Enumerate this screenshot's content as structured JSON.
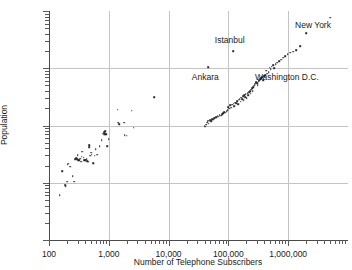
{
  "chart_data": {
    "type": "scatter",
    "title": "",
    "xlabel": "Number of Telephone Subscribers",
    "ylabel": "Population",
    "xscale": "log",
    "yscale": "log",
    "xlim": [
      100,
      10000000
    ],
    "ylim": [
      1000,
      10000000
    ],
    "grid": true,
    "legend": "none",
    "xticks": [
      {
        "value": 100,
        "label": "100"
      },
      {
        "value": 1000,
        "label": "1,000"
      },
      {
        "value": 10000,
        "label": "10,000"
      },
      {
        "value": 100000,
        "label": "100,000"
      },
      {
        "value": 1000000,
        "label": "1,000,000"
      }
    ],
    "yticks": [
      {
        "value": 1000,
        "label": "1,000"
      },
      {
        "value": 10000,
        "label": "10,000"
      },
      {
        "value": 100000,
        "label": "100,000"
      },
      {
        "value": 1000000,
        "label": "1,000,000"
      },
      {
        "value": 10000000,
        "label": "10,000,000"
      }
    ],
    "annotations": [
      {
        "text": "New York",
        "x": 5000000,
        "y": 7600000,
        "label_x": 2600000,
        "label_y": 5600000
      },
      {
        "text": "Istanbul",
        "x": 120000,
        "y": 2000000,
        "label_x": 105000,
        "label_y": 3100000
      },
      {
        "text": "Ankara",
        "x": 46000,
        "y": 1050000,
        "label_x": 41000,
        "label_y": 700000
      },
      {
        "text": "Washington D.C.",
        "x": 430000,
        "y": 900000,
        "label_x": 950000,
        "label_y": 690000
      }
    ],
    "points": [
      [
        150,
        6100
      ],
      [
        165,
        16000
      ],
      [
        185,
        9100
      ],
      [
        190,
        8600
      ],
      [
        200,
        10400
      ],
      [
        205,
        21000
      ],
      [
        215,
        21500
      ],
      [
        225,
        19200
      ],
      [
        250,
        13000
      ],
      [
        262,
        10400
      ],
      [
        275,
        25500
      ],
      [
        285,
        27000
      ],
      [
        295,
        26000
      ],
      [
        300,
        30500
      ],
      [
        310,
        24500
      ],
      [
        320,
        25000
      ],
      [
        330,
        26500
      ],
      [
        345,
        23500
      ],
      [
        355,
        28500
      ],
      [
        360,
        35000
      ],
      [
        380,
        27500
      ],
      [
        390,
        25000
      ],
      [
        400,
        24500
      ],
      [
        410,
        24800
      ],
      [
        425,
        25500
      ],
      [
        440,
        24000
      ],
      [
        455,
        23500
      ],
      [
        470,
        45000
      ],
      [
        472,
        42000
      ],
      [
        490,
        29500
      ],
      [
        505,
        33500
      ],
      [
        520,
        31000
      ],
      [
        545,
        22000
      ],
      [
        560,
        21500
      ],
      [
        580,
        29500
      ],
      [
        600,
        38500
      ],
      [
        640,
        31000
      ],
      [
        700,
        44000
      ],
      [
        760,
        55000
      ],
      [
        800,
        72000
      ],
      [
        830,
        76000
      ],
      [
        845,
        69000
      ],
      [
        855,
        74000
      ],
      [
        870,
        71000
      ],
      [
        880,
        79000
      ],
      [
        900,
        70000
      ],
      [
        930,
        44000
      ],
      [
        1000,
        58000
      ],
      [
        1400,
        190000
      ],
      [
        1420,
        112000
      ],
      [
        1500,
        106000
      ],
      [
        1800,
        112000
      ],
      [
        1850,
        68000
      ],
      [
        2000,
        66000
      ],
      [
        2400,
        180000
      ],
      [
        2600,
        92000
      ],
      [
        5700,
        310000
      ],
      [
        40000,
        98000
      ],
      [
        41500,
        96000
      ],
      [
        43000,
        104000
      ],
      [
        44000,
        112000
      ],
      [
        45000,
        118000
      ],
      [
        46000,
        1050000
      ],
      [
        47000,
        108000
      ],
      [
        48000,
        121000
      ],
      [
        50000,
        124000
      ],
      [
        52000,
        118000
      ],
      [
        54000,
        129000
      ],
      [
        56000,
        126000
      ],
      [
        58000,
        133000
      ],
      [
        60000,
        136000
      ],
      [
        63000,
        141000
      ],
      [
        66000,
        147000
      ],
      [
        69000,
        143000
      ],
      [
        72000,
        152000
      ],
      [
        75000,
        149000
      ],
      [
        78000,
        158000
      ],
      [
        82000,
        163000
      ],
      [
        86000,
        171000
      ],
      [
        90000,
        168000
      ],
      [
        94000,
        176000
      ],
      [
        98000,
        183000
      ],
      [
        100000,
        210000
      ],
      [
        103000,
        195000
      ],
      [
        108000,
        225000
      ],
      [
        112000,
        205000
      ],
      [
        116000,
        232000
      ],
      [
        120000,
        2000000
      ],
      [
        122000,
        241000
      ],
      [
        126000,
        218000
      ],
      [
        130000,
        252000
      ],
      [
        135000,
        248000
      ],
      [
        140000,
        268000
      ],
      [
        145000,
        236000
      ],
      [
        150000,
        281000
      ],
      [
        155000,
        295000
      ],
      [
        160000,
        262000
      ],
      [
        165000,
        308000
      ],
      [
        170000,
        288000
      ],
      [
        175000,
        322000
      ],
      [
        180000,
        276000
      ],
      [
        185000,
        335000
      ],
      [
        190000,
        311000
      ],
      [
        196000,
        352000
      ],
      [
        202000,
        298000
      ],
      [
        210000,
        368000
      ],
      [
        216000,
        341000
      ],
      [
        222000,
        386000
      ],
      [
        230000,
        402000
      ],
      [
        236000,
        358000
      ],
      [
        242000,
        421000
      ],
      [
        250000,
        445000
      ],
      [
        256000,
        398000
      ],
      [
        262000,
        468000
      ],
      [
        270000,
        492000
      ],
      [
        276000,
        512000
      ],
      [
        282000,
        536000
      ],
      [
        288000,
        558000
      ],
      [
        294000,
        575000
      ],
      [
        300000,
        545000
      ],
      [
        310000,
        502000
      ],
      [
        320000,
        588000
      ],
      [
        330000,
        612000
      ],
      [
        340000,
        642000
      ],
      [
        352000,
        668000
      ],
      [
        365000,
        698000
      ],
      [
        380000,
        612000
      ],
      [
        395000,
        725000
      ],
      [
        410000,
        762000
      ],
      [
        430000,
        900000
      ],
      [
        450000,
        808000
      ],
      [
        470000,
        852000
      ],
      [
        490000,
        1020000
      ],
      [
        510000,
        965000
      ],
      [
        530000,
        1060000
      ],
      [
        560000,
        1120000
      ],
      [
        590000,
        1005000
      ],
      [
        620000,
        1180000
      ],
      [
        660000,
        1240000
      ],
      [
        700000,
        1320000
      ],
      [
        760000,
        1420000
      ],
      [
        820000,
        1520000
      ],
      [
        900000,
        1640000
      ],
      [
        980000,
        1760000
      ],
      [
        1080000,
        1880000
      ],
      [
        1200000,
        1960000
      ],
      [
        1350000,
        2080000
      ],
      [
        1600000,
        2420000
      ],
      [
        2000000,
        4100000
      ],
      [
        5000000,
        7600000
      ]
    ]
  }
}
